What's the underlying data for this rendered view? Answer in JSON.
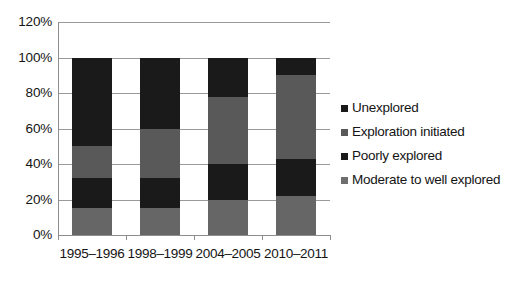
{
  "chart_data": {
    "type": "bar",
    "subtype": "100% stacked bar",
    "title": "",
    "xlabel": "",
    "ylabel": "",
    "categories": [
      "1995–1996",
      "1998–1999",
      "2004–2005",
      "2010–2011"
    ],
    "series": [
      {
        "name": "Moderate to well explored",
        "values": [
          15,
          15,
          20,
          22
        ],
        "color": "#666666"
      },
      {
        "name": "Poorly explored",
        "values": [
          17,
          17,
          20,
          21
        ],
        "color": "#1a1a1a"
      },
      {
        "name": "Exploration initiated",
        "values": [
          18,
          28,
          38,
          47
        ],
        "color": "#595959"
      },
      {
        "name": "Unexplored",
        "values": [
          50,
          40,
          22,
          10
        ],
        "color": "#1a1a1a"
      }
    ],
    "stack_order_bottom_to_top": [
      "Moderate to well explored",
      "Poorly explored",
      "Exploration initiated",
      "Unexplored"
    ],
    "ylim": [
      0,
      120
    ],
    "yticks": [
      0,
      20,
      40,
      60,
      80,
      100,
      120
    ],
    "ytick_labels": [
      "0%",
      "20%",
      "40%",
      "60%",
      "80%",
      "100%",
      "120%"
    ],
    "grid": true,
    "grid_axis": "y",
    "legend_position": "right",
    "legend_order_top_to_bottom": [
      "Unexplored",
      "Exploration initiated",
      "Poorly explored",
      "Moderate to well explored"
    ]
  },
  "axes": {
    "y_ticks": [
      {
        "label": "120%",
        "value": 120
      },
      {
        "label": "100%",
        "value": 100
      },
      {
        "label": "80%",
        "value": 80
      },
      {
        "label": "60%",
        "value": 60
      },
      {
        "label": "40%",
        "value": 40
      },
      {
        "label": "20%",
        "value": 20
      },
      {
        "label": "0%",
        "value": 0
      }
    ],
    "x_ticks": [
      {
        "label": "1995–1996"
      },
      {
        "label": "1998–1999"
      },
      {
        "label": "2004–2005"
      },
      {
        "label": "2010–2011"
      }
    ]
  },
  "legend": {
    "items": [
      {
        "label": "Unexplored",
        "color": "#1a1a1a"
      },
      {
        "label": "Exploration initiated",
        "color": "#595959"
      },
      {
        "label": "Poorly explored",
        "color": "#1a1a1a"
      },
      {
        "label": "Moderate to well explored",
        "color": "#6e6e6e"
      }
    ]
  },
  "colors": {
    "dark": "#1a1a1a",
    "mid_gray": "#595959",
    "light_gray": "#6a6a6a",
    "gridline": "#9a9a9a",
    "axis": "#8d8d8d",
    "text": "#141414",
    "background": "#ffffff"
  }
}
